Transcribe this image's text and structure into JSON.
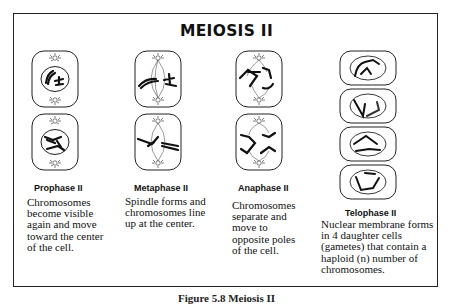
{
  "title": "MEIOSIS II",
  "stages": [
    {
      "id": "prophase-ii",
      "label": "Prophase II",
      "description_lines": [
        "Chromosomes",
        "become visible",
        "again and move",
        "toward the center",
        "of the cell."
      ]
    },
    {
      "id": "metaphase-ii",
      "label": "Metaphase II",
      "description_lines": [
        "Spindle forms and",
        "chromosomes line",
        "up at the center."
      ]
    },
    {
      "id": "anaphase-ii",
      "label": "Anaphase II",
      "description_lines": [
        "Chromosomes",
        "separate and",
        "move to",
        "opposite poles",
        "of the cell."
      ]
    },
    {
      "id": "telophase-ii",
      "label": "Telophase II",
      "description_lines": [
        "Nuclear membrane forms",
        "in 4 daughter cells",
        "(gametes) that contain a",
        "haploid (n) number of",
        "chromosomes."
      ]
    }
  ],
  "caption": "Figure 5.8 Meiosis II",
  "colors": {
    "ink": "#111111",
    "frame": "#222222",
    "background": "#ffffff"
  }
}
